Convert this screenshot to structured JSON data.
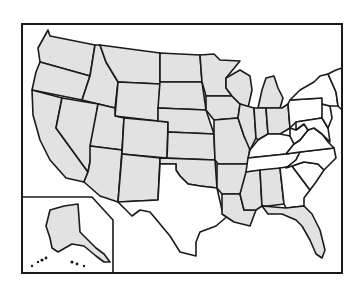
{
  "map": {
    "title": "United States",
    "colors": {
      "shaded": "#e2e2e2",
      "unshaded": "#ffffff",
      "border": "#1a1a1a"
    },
    "frame": {
      "x": 22,
      "y": 24,
      "w": 320,
      "h": 249
    },
    "alaska_inset": {
      "points": "22,197 92,197 113,220 113,273"
    },
    "states": [
      {
        "name": "Washington",
        "fill": "shaded",
        "d": "M48,30 L50,36 L95,45 L90,76 L40,62 L38,48 Z"
      },
      {
        "name": "Oregon",
        "fill": "shaded",
        "d": "M40,62 L90,76 L82,100 L32,90 L36,72 Z"
      },
      {
        "name": "California",
        "fill": "shaded",
        "d": "M32,90 L62,98 L56,128 L88,172 L84,182 L66,178 L50,160 L40,140 L33,115 Z"
      },
      {
        "name": "Idaho",
        "fill": "shaded",
        "d": "M95,45 L100,45 L106,62 L118,82 L115,108 L82,100 L90,76 Z"
      },
      {
        "name": "Nevada",
        "fill": "shaded",
        "d": "M62,98 L98,104 L90,162 L88,172 L56,128 Z"
      },
      {
        "name": "Montana",
        "fill": "shaded",
        "d": "M100,45 L160,53 L160,84 L118,82 L106,62 Z"
      },
      {
        "name": "Wyoming",
        "fill": "shaded",
        "d": "M118,82 L160,84 L158,121 L115,116 Z"
      },
      {
        "name": "Utah",
        "fill": "shaded",
        "d": "M98,104 L115,108 L115,116 L124,118 L122,150 L90,146 Z"
      },
      {
        "name": "Arizona",
        "fill": "shaded",
        "d": "M90,146 L122,150 L118,202 L100,196 L84,182 L88,172 L90,162 Z"
      },
      {
        "name": "Colorado",
        "fill": "shaded",
        "d": "M124,118 L168,122 L167,158 L122,154 Z"
      },
      {
        "name": "New Mexico",
        "fill": "shaded",
        "d": "M122,154 L160,158 L158,200 L118,202 Z"
      },
      {
        "name": "North Dakota",
        "fill": "shaded",
        "d": "M160,53 L200,55 L202,82 L160,82 Z"
      },
      {
        "name": "South Dakota",
        "fill": "shaded",
        "d": "M160,82 L202,82 L206,110 L158,108 Z"
      },
      {
        "name": "Nebraska",
        "fill": "shaded",
        "d": "M158,108 L206,110 L214,134 L168,132 L168,122 L158,121 Z"
      },
      {
        "name": "Kansas",
        "fill": "shaded",
        "d": "M168,132 L214,134 L215,160 L167,158 Z"
      },
      {
        "name": "Oklahoma",
        "fill": "shaded",
        "d": "M160,158 L215,160 L217,188 L200,186 L188,184 L180,176 L176,170 L176,164 L160,164 Z"
      },
      {
        "name": "Texas",
        "fill": "unshaded",
        "d": "M160,164 L176,164 L176,170 L180,176 L188,184 L200,186 L217,188 L222,210 L230,214 L216,226 L200,232 L196,242 L196,256 L180,252 L170,236 L160,224 L150,212 L140,210 L132,216 L118,202 L158,200 Z"
      },
      {
        "name": "Minnesota",
        "fill": "shaded",
        "d": "M200,55 L214,54 L220,60 L240,61 L226,78 L226,88 L232,96 L206,96 L202,82 Z"
      },
      {
        "name": "Iowa",
        "fill": "shaded",
        "d": "M206,96 L232,96 L240,104 L238,118 L214,120 L206,110 Z"
      },
      {
        "name": "Missouri",
        "fill": "shaded",
        "d": "M214,120 L238,118 L244,136 L250,146 L248,164 L218,164 L215,160 L214,134 Z"
      },
      {
        "name": "Arkansas",
        "fill": "shaded",
        "d": "M217,164 L248,164 L246,180 L240,194 L222,194 L217,188 Z"
      },
      {
        "name": "Louisiana",
        "fill": "shaded",
        "d": "M222,194 L240,194 L244,210 L256,210 L250,226 L234,222 L222,214 Z"
      },
      {
        "name": "Wisconsin",
        "fill": "shaded",
        "d": "M226,78 L240,70 L250,76 L252,90 L248,108 L240,104 L232,96 L226,88 Z"
      },
      {
        "name": "Illinois",
        "fill": "shaded",
        "d": "M240,104 L254,108 L256,138 L250,150 L244,136 L238,118 Z"
      },
      {
        "name": "Michigan",
        "fill": "shaded",
        "d": "M258,108 L262,90 L266,78 L274,76 L278,88 L283,98 L280,108 Z"
      },
      {
        "name": "Indiana",
        "fill": "shaded",
        "d": "M254,108 L266,108 L268,134 L258,140 L256,138 Z"
      },
      {
        "name": "Ohio",
        "fill": "shaded",
        "d": "M266,108 L282,108 L288,104 L290,128 L280,134 L268,134 Z"
      },
      {
        "name": "Kentucky",
        "fill": "unshaded",
        "d": "M250,150 L258,140 L268,134 L280,134 L290,136 L294,144 L286,154 L248,158 Z"
      },
      {
        "name": "Tennessee",
        "fill": "unshaded",
        "d": "M248,158 L286,154 L300,152 L296,160 L286,168 L246,172 Z"
      },
      {
        "name": "Mississippi",
        "fill": "shaded",
        "d": "M246,172 L260,170 L262,206 L256,210 L244,210 L240,194 Z"
      },
      {
        "name": "Alabama",
        "fill": "shaded",
        "d": "M260,170 L280,168 L284,204 L268,206 L262,206 Z"
      },
      {
        "name": "Georgia",
        "fill": "unshaded",
        "d": "M280,168 L292,166 L310,190 L304,198 L304,206 L286,208 L284,204 Z"
      },
      {
        "name": "Florida",
        "fill": "shaded",
        "d": "M262,206 L286,208 L304,206 L312,214 L320,230 L325,250 L322,258 L316,254 L310,240 L302,226 L296,220 L282,214 L268,214 Z"
      },
      {
        "name": "South Carolina",
        "fill": "unshaded",
        "d": "M292,166 L304,162 L318,164 L324,170 L316,182 L310,190 Z"
      },
      {
        "name": "North Carolina",
        "fill": "unshaded",
        "d": "M286,168 L296,160 L300,152 L334,148 L336,158 L324,170 L318,164 L304,162 L292,166 Z"
      },
      {
        "name": "Virginia",
        "fill": "unshaded",
        "d": "M286,154 L294,144 L300,140 L308,130 L314,128 L322,134 L328,142 L334,148 L300,152 Z"
      },
      {
        "name": "West Virginia",
        "fill": "unshaded",
        "d": "M290,128 L296,130 L304,124 L308,130 L300,140 L294,144 L290,136 Z"
      },
      {
        "name": "Pennsylvania",
        "fill": "unshaded",
        "d": "M288,104 L290,100 L322,98 L324,104 L322,118 L296,122 L290,128 Z"
      },
      {
        "name": "Maryland-Delaware",
        "fill": "unshaded",
        "d": "M296,122 L322,118 L328,128 L330,142 L322,134 L314,128 L308,130 L304,124 L296,130 Z"
      },
      {
        "name": "New Jersey",
        "fill": "unshaded",
        "d": "M322,104 L330,106 L332,118 L328,128 L322,118 Z"
      },
      {
        "name": "New York",
        "fill": "unshaded",
        "d": "M290,100 L300,90 L314,82 L320,76 L328,74 L336,92 L338,106 L330,106 L322,104 L322,98 Z"
      },
      {
        "name": "New England",
        "fill": "unshaded",
        "d": "M328,74 L336,70 L342,68 L342,110 L338,106 L336,92 Z"
      }
    ],
    "alaska": {
      "name": "Alaska",
      "fill": "shaded",
      "d": "M50,210 L64,206 L78,204 L80,232 L96,248 L104,254 L110,262 L104,262 L96,256 L84,246 L72,244 L58,252 L52,248 L50,238 L46,226 L48,218 Z"
    },
    "hawaii": [
      {
        "cx": 72,
        "cy": 262,
        "r": 1.6
      },
      {
        "cx": 77,
        "cy": 264,
        "r": 1.4
      },
      {
        "cx": 84,
        "cy": 266,
        "r": 1.2
      }
    ],
    "aleutians": [
      {
        "cx": 32,
        "cy": 266,
        "r": 1.2
      },
      {
        "cx": 38,
        "cy": 262,
        "r": 1.2
      },
      {
        "cx": 42,
        "cy": 260,
        "r": 1.6
      },
      {
        "cx": 46,
        "cy": 258,
        "r": 1.4
      }
    ]
  }
}
